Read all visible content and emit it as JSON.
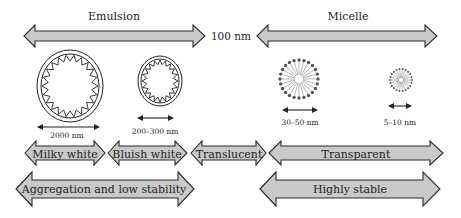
{
  "title_labels": {
    "emulsion": "Emulsion",
    "micelle": "Micelle",
    "boundary": "100 nm"
  },
  "particles": [
    {
      "name": "large-emulsion-droplet",
      "type": "emulsion",
      "size_label": "2000 nm"
    },
    {
      "name": "small-emulsion-droplet",
      "type": "emulsion",
      "size_label": "200–300 nm"
    },
    {
      "name": "large-micelle",
      "type": "micelle",
      "size_label": "30–50 nm"
    },
    {
      "name": "small-micelle",
      "type": "micelle",
      "size_label": "5–10 nm"
    }
  ],
  "appearance_arrows": [
    {
      "label": "Milky white"
    },
    {
      "label": "Bluish white"
    },
    {
      "label": "Translucent"
    },
    {
      "label": "Transparent"
    }
  ],
  "stability_arrows": [
    {
      "label": "Aggregation and low stability"
    },
    {
      "label": "Highly stable"
    }
  ],
  "colors": {
    "arrow_fill": "#c9c9c9",
    "arrow_stroke": "#2a2a2a",
    "micelle_head": "#555555"
  }
}
